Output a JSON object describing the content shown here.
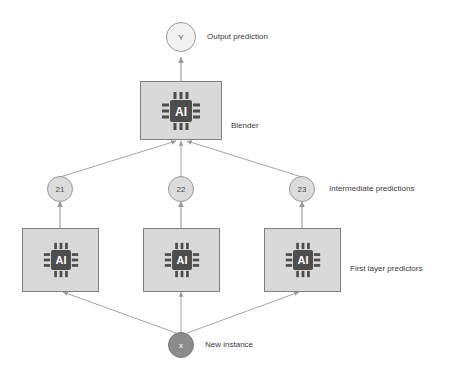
{
  "diagram": {
    "background_color": "#ffffff",
    "edge_color": "#9a9a9a",
    "nodes": {
      "output": {
        "label": "Y",
        "caption": "Output prediction"
      },
      "blender": {
        "icon": "ai-chip-icon",
        "icon_label": "AI",
        "caption": "Blender"
      },
      "intermediate": {
        "caption": "Intermediate predictions",
        "items": [
          {
            "label": "21"
          },
          {
            "label": "22"
          },
          {
            "label": "23"
          }
        ]
      },
      "first_layer": {
        "caption": "First layer predictors",
        "items": [
          {
            "icon": "ai-chip-icon",
            "icon_label": "AI"
          },
          {
            "icon": "ai-chip-icon",
            "icon_label": "AI"
          },
          {
            "icon": "ai-chip-icon",
            "icon_label": "AI"
          }
        ]
      },
      "instance": {
        "label": "x",
        "caption": "New instance"
      }
    },
    "colors": {
      "box_fill": "#d9d9d9",
      "box_stroke": "#808080",
      "chip_fill": "#4d4d4d",
      "circle_light": "#f2f2f2",
      "circle_mid": "#dcdcdc",
      "circle_dark": "#8c8c8c",
      "text": "#3d3d3d"
    }
  }
}
